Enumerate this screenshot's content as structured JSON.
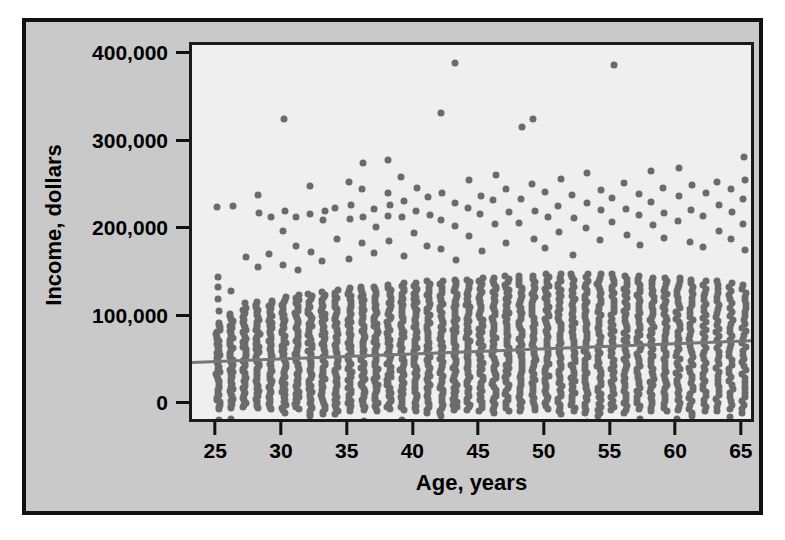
{
  "chart_data": {
    "type": "scatter",
    "title": "",
    "xlabel": "Age, years",
    "ylabel": "Income, dollars",
    "xlim": [
      23,
      66
    ],
    "ylim": [
      -22000,
      412000
    ],
    "xticks": [
      25,
      30,
      35,
      40,
      45,
      50,
      55,
      60,
      65
    ],
    "xtick_labels": [
      "25",
      "30",
      "35",
      "40",
      "45",
      "50",
      "55",
      "60",
      "65"
    ],
    "yticks": [
      0,
      100000,
      200000,
      300000,
      400000
    ],
    "ytick_labels": [
      "0",
      "100,000",
      "200,000",
      "300,000",
      "400,000"
    ],
    "grid": false,
    "legend": null,
    "point_color": "#6b6b6b",
    "point_size": 7,
    "plot_background": "#efefef",
    "panel_background": "#c9c9c9",
    "frame_color": "#111111",
    "fit_line": {
      "color": "#767676",
      "width": 3,
      "x_start": 23,
      "x_end": 66,
      "y_start": 51000,
      "y_end": 76000,
      "label": ""
    },
    "series": [
      {
        "name": "Income by age",
        "marker": "circle",
        "color": "#6b6b6b",
        "ages": [
          25,
          26,
          27,
          28,
          29,
          30,
          31,
          32,
          33,
          34,
          35,
          36,
          37,
          38,
          39,
          40,
          41,
          42,
          43,
          44,
          45,
          46,
          47,
          48,
          49,
          50,
          51,
          52,
          53,
          54,
          55,
          56,
          57,
          58,
          59,
          60,
          61,
          62,
          63,
          64,
          65
        ],
        "column_min": [
          -4000,
          -3000,
          -2000,
          -3000,
          -4000,
          -8000,
          -4000,
          -12000,
          -10000,
          -9000,
          -6000,
          -5000,
          -6000,
          -4000,
          -5000,
          -6000,
          -8000,
          -12000,
          -5000,
          -5000,
          -6000,
          -8000,
          -6000,
          -6000,
          -5000,
          -4000,
          -10000,
          -6000,
          -8000,
          -12000,
          -5000,
          -8000,
          -4000,
          -6000,
          -6000,
          -5000,
          -12000,
          -6000,
          -6000,
          -4000,
          -8000
        ],
        "column_bulk_max": [
          95000,
          105000,
          112000,
          118000,
          120000,
          124000,
          126000,
          128000,
          130000,
          132000,
          134000,
          136000,
          136000,
          138000,
          140000,
          140000,
          142000,
          142000,
          144000,
          144000,
          146000,
          146000,
          148000,
          148000,
          148000,
          150000,
          150000,
          150000,
          150000,
          150000,
          150000,
          148000,
          148000,
          146000,
          146000,
          146000,
          144000,
          142000,
          142000,
          140000,
          138000
        ],
        "column_density": [
          38,
          40,
          42,
          44,
          44,
          46,
          46,
          46,
          46,
          46,
          48,
          48,
          48,
          48,
          48,
          48,
          48,
          48,
          48,
          48,
          48,
          48,
          48,
          48,
          46,
          46,
          46,
          46,
          46,
          46,
          44,
          44,
          44,
          42,
          42,
          40,
          38,
          36,
          34,
          32,
          34
        ],
        "outliers": [
          {
            "age": 25,
            "income": 227000
          },
          {
            "age": 25,
            "income": 147000
          },
          {
            "age": 25,
            "income": 136000
          },
          {
            "age": 25,
            "income": 122000
          },
          {
            "age": 25,
            "income": 108000
          },
          {
            "age": 26,
            "income": 228000
          },
          {
            "age": 26,
            "income": 131000
          },
          {
            "age": 27,
            "income": 170000
          },
          {
            "age": 27,
            "income": 117000
          },
          {
            "age": 28,
            "income": 241000
          },
          {
            "age": 28,
            "income": 220000
          },
          {
            "age": 28,
            "income": 158000
          },
          {
            "age": 29,
            "income": 215000
          },
          {
            "age": 29,
            "income": 173000
          },
          {
            "age": 30,
            "income": 328000
          },
          {
            "age": 30,
            "income": 222000
          },
          {
            "age": 30,
            "income": 200000
          },
          {
            "age": 30,
            "income": 161000
          },
          {
            "age": 31,
            "income": 216000
          },
          {
            "age": 31,
            "income": 183000
          },
          {
            "age": 31,
            "income": 155000
          },
          {
            "age": 32,
            "income": 251000
          },
          {
            "age": 32,
            "income": 219000
          },
          {
            "age": 32,
            "income": 176000
          },
          {
            "age": 33,
            "income": 222000
          },
          {
            "age": 33,
            "income": 212000
          },
          {
            "age": 33,
            "income": 165000
          },
          {
            "age": 34,
            "income": 226000
          },
          {
            "age": 34,
            "income": 190000
          },
          {
            "age": 35,
            "income": 256000
          },
          {
            "age": 35,
            "income": 229000
          },
          {
            "age": 35,
            "income": 213000
          },
          {
            "age": 35,
            "income": 168000
          },
          {
            "age": 36,
            "income": 277000
          },
          {
            "age": 36,
            "income": 247000
          },
          {
            "age": 36,
            "income": 216000
          },
          {
            "age": 36,
            "income": 186000
          },
          {
            "age": 37,
            "income": 225000
          },
          {
            "age": 37,
            "income": 204000
          },
          {
            "age": 37,
            "income": 174000
          },
          {
            "age": 38,
            "income": 281000
          },
          {
            "age": 38,
            "income": 243000
          },
          {
            "age": 38,
            "income": 229000
          },
          {
            "age": 38,
            "income": 217000
          },
          {
            "age": 38,
            "income": 188000
          },
          {
            "age": 39,
            "income": 261000
          },
          {
            "age": 39,
            "income": 234000
          },
          {
            "age": 39,
            "income": 215000
          },
          {
            "age": 39,
            "income": 171000
          },
          {
            "age": 40,
            "income": 249000
          },
          {
            "age": 40,
            "income": 222000
          },
          {
            "age": 40,
            "income": 197000
          },
          {
            "age": 41,
            "income": 238000
          },
          {
            "age": 41,
            "income": 218000
          },
          {
            "age": 41,
            "income": 182000
          },
          {
            "age": 42,
            "income": 334000
          },
          {
            "age": 42,
            "income": 243000
          },
          {
            "age": 42,
            "income": 212000
          },
          {
            "age": 42,
            "income": 179000
          },
          {
            "age": 43,
            "income": 392000
          },
          {
            "age": 43,
            "income": 232000
          },
          {
            "age": 43,
            "income": 205000
          },
          {
            "age": 43,
            "income": 166000
          },
          {
            "age": 44,
            "income": 258000
          },
          {
            "age": 44,
            "income": 226000
          },
          {
            "age": 44,
            "income": 194000
          },
          {
            "age": 45,
            "income": 240000
          },
          {
            "age": 45,
            "income": 219000
          },
          {
            "age": 45,
            "income": 177000
          },
          {
            "age": 46,
            "income": 264000
          },
          {
            "age": 46,
            "income": 235000
          },
          {
            "age": 46,
            "income": 208000
          },
          {
            "age": 47,
            "income": 247000
          },
          {
            "age": 47,
            "income": 221000
          },
          {
            "age": 47,
            "income": 186000
          },
          {
            "age": 48,
            "income": 318000
          },
          {
            "age": 48,
            "income": 236000
          },
          {
            "age": 48,
            "income": 209000
          },
          {
            "age": 49,
            "income": 328000
          },
          {
            "age": 49,
            "income": 253000
          },
          {
            "age": 49,
            "income": 222000
          },
          {
            "age": 49,
            "income": 191000
          },
          {
            "age": 50,
            "income": 244000
          },
          {
            "age": 50,
            "income": 216000
          },
          {
            "age": 50,
            "income": 180000
          },
          {
            "age": 51,
            "income": 259000
          },
          {
            "age": 51,
            "income": 228000
          },
          {
            "age": 51,
            "income": 198000
          },
          {
            "age": 52,
            "income": 241000
          },
          {
            "age": 52,
            "income": 214000
          },
          {
            "age": 52,
            "income": 172000
          },
          {
            "age": 53,
            "income": 266000
          },
          {
            "age": 53,
            "income": 231000
          },
          {
            "age": 53,
            "income": 203000
          },
          {
            "age": 54,
            "income": 246000
          },
          {
            "age": 54,
            "income": 223000
          },
          {
            "age": 54,
            "income": 189000
          },
          {
            "age": 55,
            "income": 389000
          },
          {
            "age": 55,
            "income": 237000
          },
          {
            "age": 55,
            "income": 210000
          },
          {
            "age": 56,
            "income": 254000
          },
          {
            "age": 56,
            "income": 225000
          },
          {
            "age": 56,
            "income": 195000
          },
          {
            "age": 57,
            "income": 242000
          },
          {
            "age": 57,
            "income": 218000
          },
          {
            "age": 57,
            "income": 184000
          },
          {
            "age": 58,
            "income": 268000
          },
          {
            "age": 58,
            "income": 233000
          },
          {
            "age": 58,
            "income": 206000
          },
          {
            "age": 59,
            "income": 249000
          },
          {
            "age": 59,
            "income": 220000
          },
          {
            "age": 59,
            "income": 192000
          },
          {
            "age": 60,
            "income": 271000
          },
          {
            "age": 60,
            "income": 239000
          },
          {
            "age": 60,
            "income": 211000
          },
          {
            "age": 61,
            "income": 252000
          },
          {
            "age": 61,
            "income": 224000
          },
          {
            "age": 61,
            "income": 187000
          },
          {
            "age": 62,
            "income": 243000
          },
          {
            "age": 62,
            "income": 217000
          },
          {
            "age": 62,
            "income": 181000
          },
          {
            "age": 63,
            "income": 256000
          },
          {
            "age": 63,
            "income": 229000
          },
          {
            "age": 63,
            "income": 199000
          },
          {
            "age": 64,
            "income": 247000
          },
          {
            "age": 64,
            "income": 221000
          },
          {
            "age": 64,
            "income": 190000
          },
          {
            "age": 65,
            "income": 284000
          },
          {
            "age": 65,
            "income": 258000
          },
          {
            "age": 65,
            "income": 236000
          },
          {
            "age": 65,
            "income": 208000
          },
          {
            "age": 65,
            "income": 178000
          }
        ]
      }
    ]
  }
}
